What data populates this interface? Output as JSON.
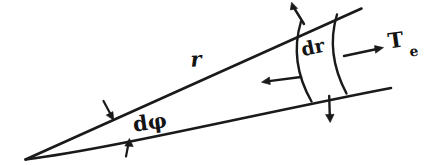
{
  "figure": {
    "kind": "hand-drawn-diagram",
    "background_color": "#ffffff",
    "ink_color": "#1a1a1a",
    "width": 445,
    "height": 165
  },
  "labels": {
    "radius": "r",
    "angle": "dφ",
    "radial_thickness": "dr",
    "tension": "T",
    "tension_subscript": "e"
  },
  "geometry": {
    "apex": [
      25,
      159
    ],
    "upper_line_end": [
      361,
      8
    ],
    "lower_line_end": [
      391,
      88
    ],
    "inner_arc": {
      "start": [
        301,
        22
      ],
      "end": [
        311,
        101
      ],
      "bulge": 9
    },
    "outer_arc": {
      "start": [
        337,
        15
      ],
      "end": [
        346,
        93
      ],
      "bulge": 9
    }
  },
  "arrows": [
    {
      "name": "outward-normal-upper",
      "direction": "up-left",
      "from": [
        303,
        23
      ],
      "to": [
        292,
        3
      ]
    },
    {
      "name": "inward-radial",
      "direction": "left",
      "from": [
        301,
        77
      ],
      "to": [
        262,
        82
      ]
    },
    {
      "name": "outward-normal-lower",
      "direction": "down",
      "from": [
        329,
        96
      ],
      "to": [
        330,
        122
      ]
    },
    {
      "name": "tension-outward-radial",
      "direction": "right",
      "from": [
        344,
        56
      ],
      "to": [
        383,
        48
      ]
    },
    {
      "name": "angle-tick-upper",
      "direction": "down-right",
      "from": [
        104,
        101
      ],
      "to": [
        113,
        119
      ]
    },
    {
      "name": "angle-tick-lower",
      "direction": "up",
      "from": [
        126,
        156
      ],
      "to": [
        129,
        139
      ]
    }
  ],
  "label_positions": {
    "radius": [
      196,
      61
    ],
    "angle": [
      150,
      124
    ],
    "radial_thickness": [
      305,
      48
    ],
    "tension": [
      394,
      42
    ],
    "tension_subscript": [
      412,
      51
    ]
  }
}
